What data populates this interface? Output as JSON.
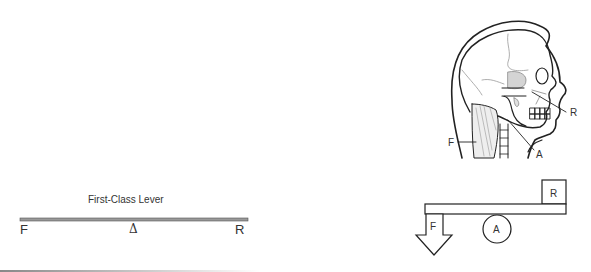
{
  "first_class_lever": {
    "title": "First-Class Lever",
    "labels": {
      "force": "F",
      "fulcrum": "Δ",
      "resistance": "R"
    }
  },
  "head_diagram": {
    "labels": {
      "force": "F",
      "axis": "A",
      "resistance": "R"
    }
  },
  "lever_model": {
    "labels": {
      "force": "F",
      "axis": "A",
      "resistance": "R"
    }
  },
  "colors": {
    "line": "#222222",
    "bar": "#888888",
    "shade": "#cfcfcf"
  }
}
